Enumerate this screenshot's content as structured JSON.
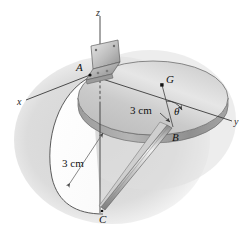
{
  "figure": {
    "background_color": "#ffffff",
    "shadow_color": "#d9d9d9",
    "disk_top_color": "#c9c9c9",
    "disk_edge_color": "#a8a8a8",
    "line_color": "#3a3a3a",
    "rod_color": "#bdbdbd"
  },
  "axes": {
    "z_label": "z",
    "x_label": "x",
    "y_label": "y"
  },
  "points": {
    "a_label": "A",
    "g_label": "G",
    "b_label": "B",
    "c_label": "C"
  },
  "dimensions": {
    "radius_label": "3 cm",
    "rod_label": "3 cm"
  },
  "angles": {
    "theta_label": "θ"
  }
}
